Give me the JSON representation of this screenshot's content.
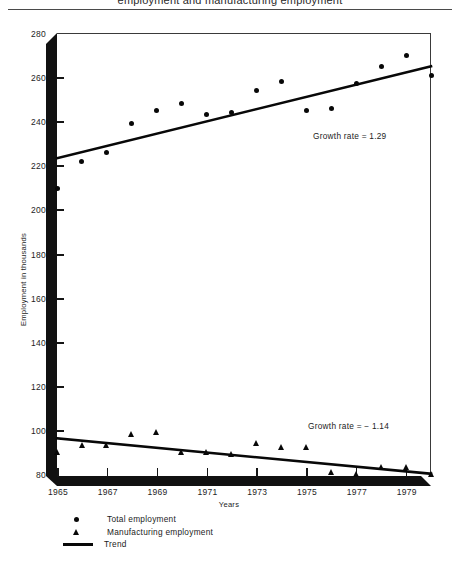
{
  "figure": {
    "clipped_header": "employment and manufacturing employment"
  },
  "axes": {
    "y_title": "Employment in thousands",
    "x_title": "Years",
    "y_ticks": [
      "280",
      "260",
      "240",
      "220",
      "200",
      "180",
      "160",
      "140",
      "120",
      "100",
      "80"
    ],
    "x_ticks": [
      "1965",
      "1967",
      "1969",
      "1971",
      "1973",
      "1975",
      "1977",
      "1979"
    ]
  },
  "annotations": {
    "total_growth": "Growth rate = 1.29",
    "manufacturing_growth": "Growth rate =  − 1.14"
  },
  "legend": {
    "items": [
      {
        "label": "Total employment",
        "symbol": "circle-marker"
      },
      {
        "label": "Manufacturing employment",
        "symbol": "triangle-marker"
      },
      {
        "label": "Trend",
        "symbol": "line-marker"
      }
    ]
  },
  "chart_data": {
    "type": "scatter",
    "title": "",
    "xlabel": "Years",
    "ylabel": "Employment in thousands",
    "xlim": [
      1965,
      1980
    ],
    "ylim": [
      80,
      280
    ],
    "y_ticks": [
      80,
      100,
      120,
      140,
      160,
      180,
      200,
      220,
      240,
      260,
      280
    ],
    "x_ticks": [
      1965,
      1967,
      1969,
      1971,
      1973,
      1975,
      1977,
      1979
    ],
    "grid": false,
    "legend_position": "below-axes-left",
    "x": [
      1965,
      1966,
      1967,
      1968,
      1969,
      1970,
      1971,
      1972,
      1973,
      1974,
      1975,
      1976,
      1977,
      1978,
      1979,
      1980
    ],
    "series": [
      {
        "name": "Total employment",
        "marker": "circle",
        "values": [
          210,
          222,
          226,
          239,
          245,
          248,
          243,
          244,
          254,
          258,
          245,
          246,
          257,
          265,
          270,
          261
        ],
        "trend": {
          "label": "Growth rate = 1.29",
          "start": [
            1965,
            223.5
          ],
          "end": [
            1980,
            265
          ]
        }
      },
      {
        "name": "Manufacturing employment",
        "marker": "triangle",
        "values": [
          91,
          94,
          94,
          99,
          100,
          91,
          91,
          90,
          95,
          93,
          93,
          82,
          81,
          84,
          84,
          81
        ],
        "trend": {
          "label": "Growth rate =  − 1.14",
          "start": [
            1965,
            97
          ],
          "end": [
            1980,
            81
          ]
        }
      }
    ]
  }
}
